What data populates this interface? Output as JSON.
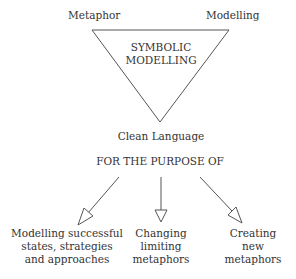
{
  "diagram": {
    "triangle": {
      "center_label_line1": "SYMBOLIC",
      "center_label_line2": "MODELLING",
      "top_left_label": "Metaphor",
      "top_right_label": "Modelling",
      "bottom_label": "Clean Language"
    },
    "purpose_label": "FOR THE PURPOSE OF",
    "outcomes": [
      {
        "lines": [
          "Modelling successful",
          "states, strategies",
          "and approaches"
        ]
      },
      {
        "lines": [
          "Changing",
          "limiting",
          "metaphors"
        ]
      },
      {
        "lines": [
          "Creating",
          "new",
          "metaphors"
        ]
      }
    ],
    "colors": {
      "stroke": "#555555",
      "text": "#333333",
      "background": "#ffffff"
    }
  }
}
